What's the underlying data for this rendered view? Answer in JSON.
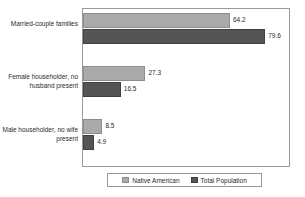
{
  "chart_data": {
    "type": "bar",
    "orientation": "horizontal",
    "title": "",
    "subtitle": "",
    "xlabel": "",
    "ylabel": "",
    "grid": false,
    "legend_position": "bottom",
    "xlim": [
      0,
      90
    ],
    "categories": [
      "Married-couple\nfamilies",
      "Female householder,\nno husband present",
      "Male householder,\nno wife present"
    ],
    "series": [
      {
        "name": "Native American",
        "color": "#a9a9a9",
        "values": [
          64.2,
          27.3,
          8.5
        ],
        "labels": [
          "64.2",
          "27.3",
          "8.5"
        ]
      },
      {
        "name": "Total Population",
        "color": "#555555",
        "values": [
          79.6,
          16.5,
          4.9
        ],
        "labels": [
          "79.6",
          "16.5",
          "4.9"
        ]
      }
    ]
  },
  "legend": {
    "items": [
      {
        "label": "Native American"
      },
      {
        "label": "Total Population"
      }
    ]
  }
}
